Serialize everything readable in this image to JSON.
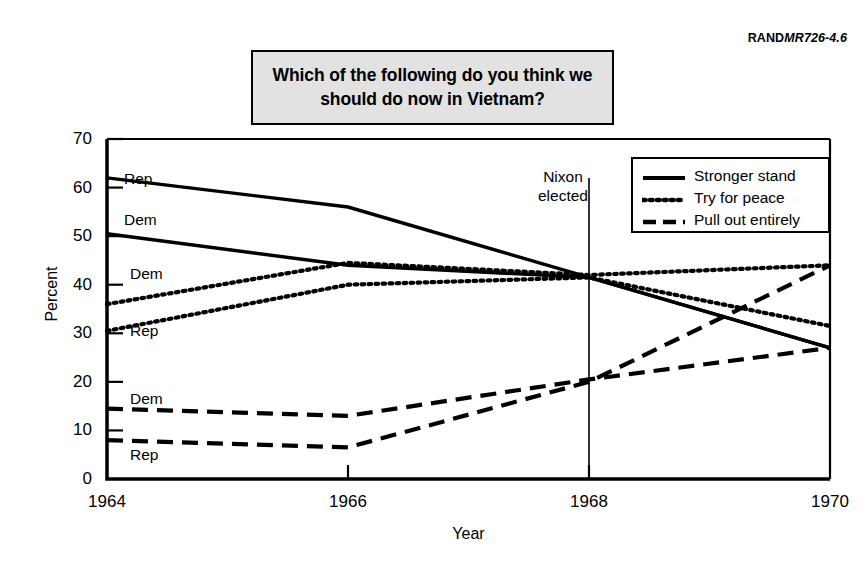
{
  "source_code": {
    "prefix": "RAND",
    "suffix": "MR726-4.6"
  },
  "title": "Which of the following do you think we should do now in Vietnam?",
  "annotation": {
    "line1": "Nixon",
    "line2": "elected",
    "year": 1968
  },
  "legend": {
    "items": [
      {
        "label": "Stronger stand",
        "style": "solid"
      },
      {
        "label": "Try for peace",
        "style": "dotted"
      },
      {
        "label": "Pull out entirely",
        "style": "dashed"
      }
    ]
  },
  "series_tags": [
    {
      "label": "Rep",
      "series": "stronger-stand-rep"
    },
    {
      "label": "Dem",
      "series": "stronger-stand-dem"
    },
    {
      "label": "Dem",
      "series": "try-for-peace-dem"
    },
    {
      "label": "Rep",
      "series": "try-for-peace-rep"
    },
    {
      "label": "Dem",
      "series": "pull-out-dem"
    },
    {
      "label": "Rep",
      "series": "pull-out-rep"
    }
  ],
  "chart_data": {
    "type": "line",
    "title": "Which of the following do you think we should do now in Vietnam?",
    "xlabel": "Year",
    "ylabel": "Percent",
    "x": [
      1964,
      1966,
      1968,
      1970
    ],
    "xlim": [
      1964,
      1970
    ],
    "ylim": [
      0,
      70
    ],
    "ytick_labels": [
      "0",
      "10",
      "20",
      "30",
      "40",
      "50",
      "60",
      "70"
    ],
    "yticks": [
      0,
      10,
      20,
      30,
      40,
      50,
      60,
      70
    ],
    "xtick_labels": [
      "1964",
      "1966",
      "1968",
      "1970"
    ],
    "grid": false,
    "legend_position": "top-right",
    "annotations": [
      {
        "text": "Nixon elected",
        "x": 1968,
        "type": "vertical-line"
      }
    ],
    "series": [
      {
        "name": "Stronger stand - Rep",
        "answer": "Stronger stand",
        "party": "Rep",
        "style": "solid",
        "inline_label": "Rep",
        "values": [
          62,
          56,
          41.5,
          27
        ]
      },
      {
        "name": "Stronger stand - Dem",
        "answer": "Stronger stand",
        "party": "Dem",
        "style": "solid",
        "inline_label": "Dem",
        "values": [
          50.5,
          44,
          41.5,
          27
        ]
      },
      {
        "name": "Try for peace - Dem",
        "answer": "Try for peace",
        "party": "Dem",
        "style": "dotted",
        "inline_label": "Dem",
        "values": [
          36,
          44.5,
          42,
          44
        ]
      },
      {
        "name": "Try for peace - Rep",
        "answer": "Try for peace",
        "party": "Rep",
        "style": "dotted",
        "inline_label": "Rep",
        "values": [
          30.5,
          40,
          41.5,
          31.5
        ]
      },
      {
        "name": "Pull out entirely - Dem",
        "answer": "Pull out entirely",
        "party": "Dem",
        "style": "dashed",
        "inline_label": "Dem",
        "values": [
          14.5,
          13,
          20.5,
          27
        ]
      },
      {
        "name": "Pull out entirely - Rep",
        "answer": "Pull out entirely",
        "party": "Rep",
        "style": "dashed",
        "inline_label": "Rep",
        "values": [
          8,
          6.5,
          20,
          44
        ]
      }
    ]
  },
  "colors": {
    "ink": "#000000",
    "title_bg": "#e2e2e2",
    "page_bg": "#ffffff"
  }
}
